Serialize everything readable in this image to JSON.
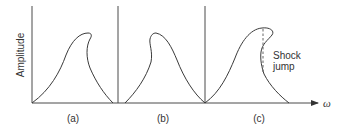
{
  "figure": {
    "y_axis_label": "Amplitude",
    "x_axis_label": "ω",
    "annotation": {
      "line1": "Shock",
      "line2": "jump"
    },
    "panels": [
      {
        "id": "a",
        "label": "(a)",
        "description": "Curve bending toward higher frequency (hardening)"
      },
      {
        "id": "b",
        "label": "(b)",
        "description": "Curve bending toward lower frequency (softening)"
      },
      {
        "id": "c",
        "label": "(c)",
        "description": "Strongly bent curve with shock jump (dashed vertical)"
      }
    ],
    "colors": {
      "line": "#3a3a3a",
      "axis": "#4a4a4a",
      "text": "#333333",
      "background": "#ffffff"
    }
  }
}
